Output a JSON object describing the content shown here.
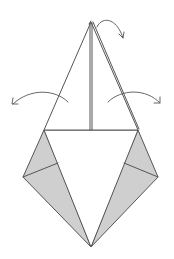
{
  "diagram": {
    "title": "",
    "colors": {
      "line": "#555555",
      "shade": "#cfcfcf",
      "paper": "#ffffff",
      "background": "#ffffff"
    },
    "points": {
      "apex": [
        91,
        22
      ],
      "left_shoulder": [
        44,
        130
      ],
      "right_shoulder": [
        138,
        130
      ],
      "left_wing": [
        23,
        177
      ],
      "right_wing": [
        158,
        177
      ],
      "left_crease": [
        58,
        163
      ],
      "right_crease": [
        124,
        163
      ],
      "bottom_tip": [
        91,
        247
      ]
    },
    "arrows": [
      {
        "name": "top-flap-arrow",
        "direction": "right-down"
      },
      {
        "name": "left-fold-arrow",
        "direction": "left"
      },
      {
        "name": "right-fold-arrow",
        "direction": "right"
      }
    ],
    "labels": []
  }
}
